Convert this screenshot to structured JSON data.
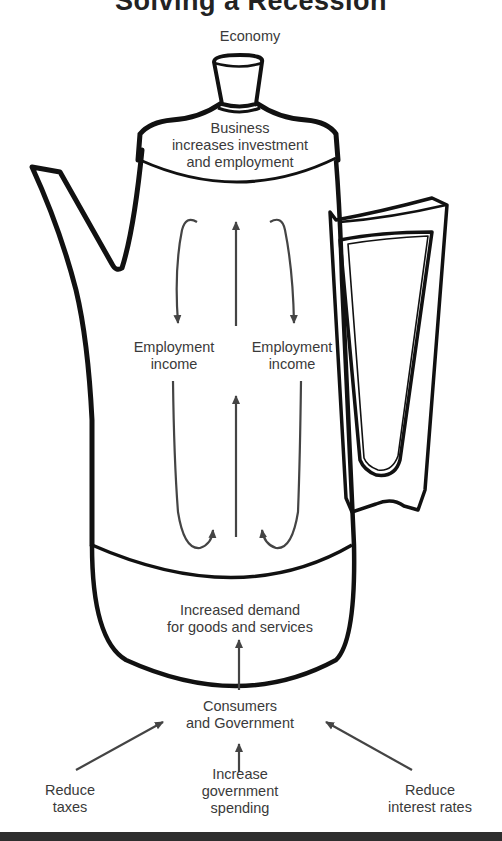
{
  "title": "Solving a Recession",
  "labels": {
    "economy": "Economy",
    "business_line1": "Business",
    "business_line2": "increases investment",
    "business_line3": "and employment",
    "employment_income_left_1": "Employment",
    "employment_income_left_2": "income",
    "employment_income_right_1": "Employment",
    "employment_income_right_2": "income",
    "demand_line1": "Increased demand",
    "demand_line2": "for goods and services",
    "consumers_line1": "Consumers",
    "consumers_line2": "and Government",
    "reduce_taxes_1": "Reduce",
    "reduce_taxes_2": "taxes",
    "increase_spending_1": "Increase",
    "increase_spending_2": "government",
    "increase_spending_3": "spending",
    "reduce_rates_1": "Reduce",
    "reduce_rates_2": "interest rates"
  },
  "colors": {
    "outline": "#111111",
    "arrow": "#444444",
    "text": "#3a3a3a",
    "band": "#2e2e2e"
  }
}
